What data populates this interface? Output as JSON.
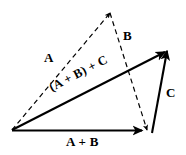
{
  "figure": {
    "stroke_color": "#000000",
    "background_color": "#ffffff"
  },
  "labels": {
    "a": "A",
    "b": "B",
    "c": "C",
    "a_plus_b": "A + B",
    "sum": "(A + B) + C"
  },
  "geometry": {
    "origin": {
      "x": 12,
      "y": 130
    },
    "apex": {
      "x": 110,
      "y": 13
    },
    "right_apex": {
      "x": 167,
      "y": 50
    },
    "bottom_right": {
      "x": 150,
      "y": 132
    },
    "vectors": [
      {
        "name": "A",
        "style": "dashed",
        "from": [
          12,
          130
        ],
        "to": [
          110,
          13
        ]
      },
      {
        "name": "B",
        "style": "dashed",
        "from": [
          110,
          13
        ],
        "to": [
          147,
          130
        ]
      },
      {
        "name": "A + B",
        "style": "solid",
        "from": [
          12,
          130
        ],
        "to": [
          143,
          130
        ]
      },
      {
        "name": "C",
        "style": "solid",
        "from": [
          152,
          133
        ],
        "to": [
          167,
          50
        ]
      },
      {
        "name": "(A + B) + C",
        "style": "solid",
        "from": [
          12,
          130
        ],
        "to": [
          166,
          51
        ]
      }
    ]
  }
}
